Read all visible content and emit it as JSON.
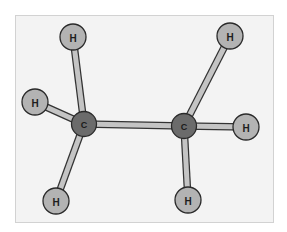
{
  "diagram": {
    "colors": {
      "frame_bg": "#f3f3f3",
      "frame_border": "#d2d2d2",
      "bond": "#c4c4c4",
      "hydrogen": "#b3b3b3",
      "carbon": "#6b6b6b",
      "outline": "#2a2a2a"
    },
    "atoms": [
      {
        "id": "C1",
        "element": "C",
        "label": "C"
      },
      {
        "id": "C2",
        "element": "C",
        "label": "C"
      },
      {
        "id": "H1",
        "element": "H",
        "label": "H"
      },
      {
        "id": "H2",
        "element": "H",
        "label": "H"
      },
      {
        "id": "H3",
        "element": "H",
        "label": "H"
      },
      {
        "id": "H4",
        "element": "H",
        "label": "H"
      },
      {
        "id": "H5",
        "element": "H",
        "label": "H"
      },
      {
        "id": "H6",
        "element": "H",
        "label": "H"
      }
    ],
    "bonds": [
      {
        "from": "C1",
        "to": "C2"
      },
      {
        "from": "C1",
        "to": "H1"
      },
      {
        "from": "C1",
        "to": "H2"
      },
      {
        "from": "C1",
        "to": "H3"
      },
      {
        "from": "C2",
        "to": "H4"
      },
      {
        "from": "C2",
        "to": "H5"
      },
      {
        "from": "C2",
        "to": "H6"
      }
    ]
  }
}
